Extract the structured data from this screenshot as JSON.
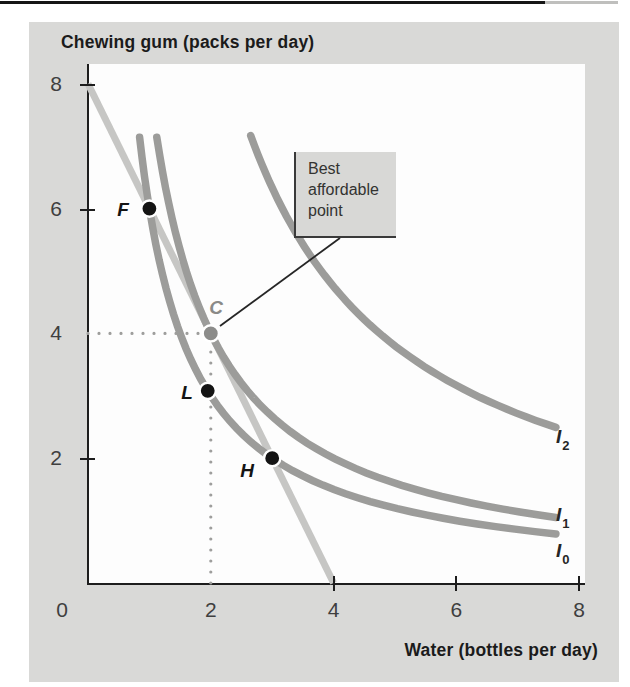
{
  "figure": {
    "y_axis_title": "Chewing gum (packs per day)",
    "x_axis_title": "Water (bottles per day)",
    "annotation_text": "Best affordable point"
  },
  "chart_data": {
    "type": "line",
    "title": "",
    "xlabel": "Water (bottles per day)",
    "ylabel": "Chewing gum (packs per day)",
    "xlim": [
      0,
      8.1
    ],
    "ylim": [
      0,
      8.3
    ],
    "grid": false,
    "x_ticks": [
      0,
      2,
      4,
      6,
      8
    ],
    "y_ticks": [
      0,
      2,
      4,
      6,
      8
    ],
    "x_tick_labels": [
      "0",
      "2",
      "4",
      "6",
      "8"
    ],
    "y_tick_labels_top_to_bottom": [
      "8",
      "6",
      "4",
      "2"
    ],
    "x_tick_marks_at": [
      4,
      6,
      8
    ],
    "y_tick_marks_at": [
      2,
      6,
      8
    ],
    "colors": {
      "panel": "#d9d9d7",
      "curve": "#9c9c9a",
      "budget_line": "#c6c6c4",
      "point_black": "#141414",
      "point_c": "#8c8c8a",
      "guide_dots": "#9e9e9c",
      "leader": "#262626"
    },
    "series": [
      {
        "name": "budget-line",
        "kind": "polyline",
        "points": [
          [
            0,
            8
          ],
          [
            4,
            0
          ]
        ],
        "color": "#c6c6c4",
        "width": 7
      },
      {
        "name": "indifference-curve-I0",
        "kind": "hyperbola",
        "k": 6,
        "x_min": 0.84,
        "x_max": 7.62,
        "color": "#9c9c9a",
        "width": 7.5,
        "label": "I",
        "sub": "0"
      },
      {
        "name": "indifference-curve-I1",
        "kind": "hyperbola",
        "k": 8,
        "x_min": 1.12,
        "x_max": 7.62,
        "color": "#9c9c9a",
        "width": 7.5,
        "label": "I",
        "sub": "1"
      },
      {
        "name": "indifference-curve-I2",
        "kind": "hyperbola",
        "k": 19,
        "x_min": 2.65,
        "x_max": 7.62,
        "color": "#9c9c9a",
        "width": 7.5,
        "label": "I",
        "sub": "2"
      }
    ],
    "points": [
      {
        "name": "F",
        "x": 1,
        "y": 6,
        "color": "#141414"
      },
      {
        "name": "C",
        "x": 2,
        "y": 4,
        "color": "#8c8c8a"
      },
      {
        "name": "L",
        "x": 1.95,
        "y": 3.08,
        "color": "#141414"
      },
      {
        "name": "H",
        "x": 3,
        "y": 2,
        "color": "#141414"
      }
    ],
    "guides": [
      {
        "kind": "h-dotted",
        "y": 4,
        "x_from": 0,
        "x_to": 1.82
      },
      {
        "kind": "v-dotted",
        "x": 2,
        "y_from": 0,
        "y_to": 3.82
      }
    ],
    "annotation": {
      "text": "Best affordable point",
      "target_point": "C"
    }
  }
}
